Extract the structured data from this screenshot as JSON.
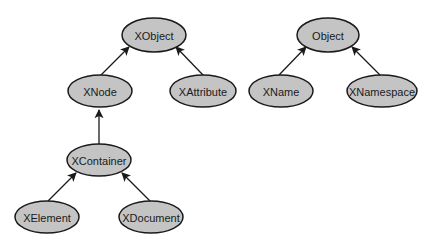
{
  "diagram": {
    "type": "class-hierarchy",
    "nodes": [
      {
        "id": "xobject",
        "label": "XObject",
        "cx": 154,
        "cy": 35,
        "rx": 32,
        "ry": 17
      },
      {
        "id": "xnode",
        "label": "XNode",
        "cx": 100,
        "cy": 91,
        "rx": 32,
        "ry": 16
      },
      {
        "id": "xattribute",
        "label": "XAttribute",
        "cx": 203,
        "cy": 91,
        "rx": 33,
        "ry": 16
      },
      {
        "id": "xcontainer",
        "label": "XContainer",
        "cx": 99,
        "cy": 160,
        "rx": 32,
        "ry": 16
      },
      {
        "id": "xelement",
        "label": "XElement",
        "cx": 47,
        "cy": 217,
        "rx": 32,
        "ry": 16
      },
      {
        "id": "xdocument",
        "label": "XDocument",
        "cx": 151,
        "cy": 217,
        "rx": 32,
        "ry": 16
      },
      {
        "id": "object",
        "label": "Object",
        "cx": 328,
        "cy": 35,
        "rx": 31,
        "ry": 17
      },
      {
        "id": "xname",
        "label": "XName",
        "cx": 281,
        "cy": 91,
        "rx": 32,
        "ry": 16
      },
      {
        "id": "xnamespace",
        "label": "XNamespace",
        "cx": 382,
        "cy": 91,
        "rx": 35,
        "ry": 16
      }
    ],
    "edges": [
      {
        "from": "xnode",
        "to": "xobject",
        "x1": 101,
        "y1": 75,
        "x2": 129,
        "y2": 47
      },
      {
        "from": "xattribute",
        "to": "xobject",
        "x1": 203,
        "y1": 75,
        "x2": 176,
        "y2": 47
      },
      {
        "from": "xcontainer",
        "to": "xnode",
        "x1": 99,
        "y1": 144,
        "x2": 99,
        "y2": 110
      },
      {
        "from": "xelement",
        "to": "xcontainer",
        "x1": 48,
        "y1": 201,
        "x2": 76,
        "y2": 173
      },
      {
        "from": "xdocument",
        "to": "xcontainer",
        "x1": 150,
        "y1": 201,
        "x2": 122,
        "y2": 173
      },
      {
        "from": "xname",
        "to": "object",
        "x1": 279,
        "y1": 75,
        "x2": 306,
        "y2": 47
      },
      {
        "from": "xnamespace",
        "to": "object",
        "x1": 380,
        "y1": 75,
        "x2": 352,
        "y2": 47
      }
    ]
  },
  "colors": {
    "node_fill": "#c4c4c4",
    "stroke": "#1a1a1a",
    "background": "#ffffff"
  }
}
